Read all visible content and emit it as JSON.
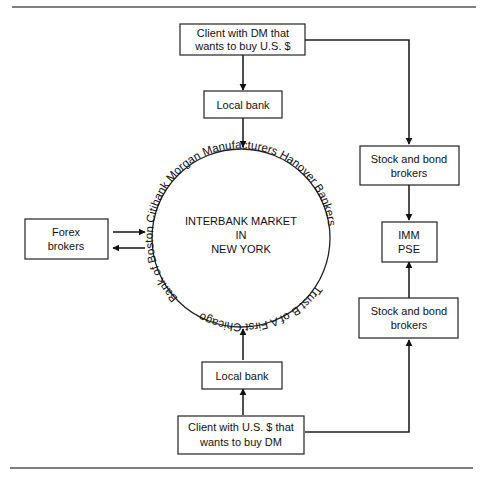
{
  "diagram": {
    "top_client": [
      "Client with DM that",
      "wants to buy U.S. $"
    ],
    "top_local_bank": "Local bank",
    "bottom_local_bank": "Local bank",
    "bottom_client": [
      "Client with U.S. $ that",
      "wants to buy DM"
    ],
    "forex_brokers": [
      "Forex",
      "brokers"
    ],
    "top_stock_brokers": [
      "Stock and bond",
      "brokers"
    ],
    "bottom_stock_brokers": [
      "Stock and bond",
      "brokers"
    ],
    "imm_pse": [
      "IMM",
      "PSE"
    ],
    "interbank_market": [
      "INTERBANK MARKET",
      "IN",
      "NEW YORK"
    ],
    "ring_banks_top": "Bank of Boston  Citibank  Morgan  Manufacturers Hanover  Bankers",
    "ring_banks_bottom": "Trust  B of A  First Chicago"
  }
}
